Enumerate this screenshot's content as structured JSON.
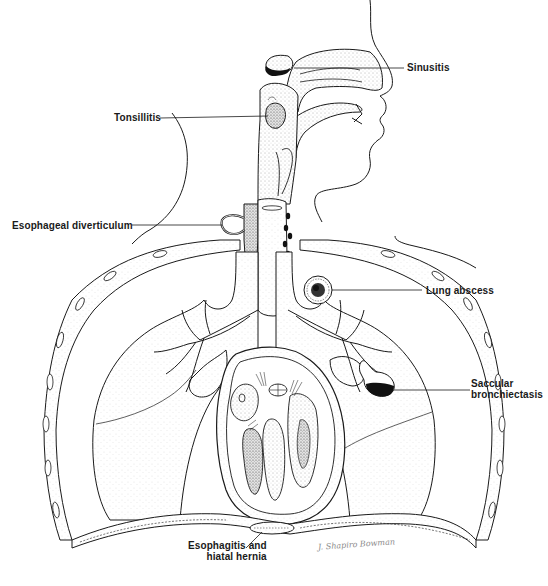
{
  "figure": {
    "colors": {
      "ink": "#1a1a1a",
      "stipple": "#555555",
      "background": "#ffffff",
      "signature": "#8a8a8a"
    }
  },
  "labels": {
    "sinusitis": "Sinusitis",
    "tonsillitis": "Tonsillitis",
    "esophageal_diverticulum": "Esophageal diverticulum",
    "lung_abscess": "Lung abscess",
    "saccular_bronchiectasis_line1": "Saccular",
    "saccular_bronchiectasis_line2": "bronchiectasis",
    "esophagitis_line1": "Esophagitis and",
    "esophagitis_line2": "hiatal hernia"
  },
  "signature": "J. Shapiro Bowman"
}
